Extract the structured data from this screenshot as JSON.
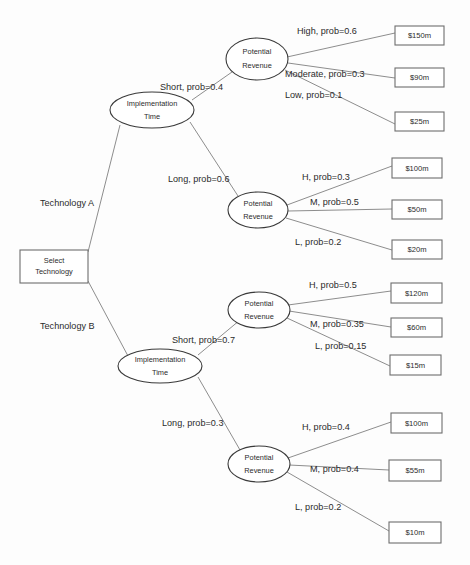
{
  "diagram": {
    "type": "decision-tree",
    "background_color": "#fdfdfd",
    "line_color": "#808080",
    "box_stroke_color": "#6e6e6e",
    "ellipse_stroke_color": "#3a3a3a",
    "text_color": "#2b2b2b"
  },
  "root": {
    "label_line1": "Select",
    "label_line2": "Technology",
    "shape": "rectangle",
    "x": 20,
    "y": 250,
    "w": 68,
    "h": 33
  },
  "decision_branches": [
    {
      "id": "tech-a",
      "label": "Technology A",
      "x": 40,
      "y": 204
    },
    {
      "id": "tech-b",
      "label": "Technology B",
      "x": 40,
      "y": 327
    }
  ],
  "chance_nodes": [
    {
      "id": "impl-time-a",
      "label_line1": "Implementation",
      "label_line2": "Time",
      "shape": "ellipse",
      "cx": 152,
      "cy": 110,
      "rx": 42,
      "ry": 18
    },
    {
      "id": "impl-time-b",
      "label_line1": "Implementation",
      "label_line2": "Time",
      "shape": "ellipse",
      "cx": 160,
      "cy": 366,
      "rx": 42,
      "ry": 17
    },
    {
      "id": "potential-revenue-1",
      "label_line1": "Potential",
      "label_line2": "Revenue",
      "shape": "ellipse",
      "cx": 257,
      "cy": 59,
      "rx": 31,
      "ry": 21
    },
    {
      "id": "potential-revenue-2",
      "label_line1": "Potential",
      "label_line2": "Revenue",
      "shape": "ellipse",
      "cx": 258,
      "cy": 210,
      "rx": 30,
      "ry": 18
    },
    {
      "id": "potential-revenue-3",
      "label_line1": "Potential",
      "label_line2": "Revenue",
      "shape": "ellipse",
      "cx": 259,
      "cy": 310,
      "rx": 31,
      "ry": 18
    },
    {
      "id": "potential-revenue-4",
      "label_line1": "Potential",
      "label_line2": "Revenue",
      "shape": "ellipse",
      "cx": 259,
      "cy": 464,
      "rx": 31,
      "ry": 18
    }
  ],
  "time_branches": [
    {
      "id": "a-short",
      "label": "Short, prob=0.4",
      "x": 160,
      "y": 88
    },
    {
      "id": "a-long",
      "label": "Long, prob=0.6",
      "x": 168,
      "y": 180
    },
    {
      "id": "b-short",
      "label": "Short, prob=0.7",
      "x": 172,
      "y": 341
    },
    {
      "id": "b-long",
      "label": "Long, prob=0.3",
      "x": 162,
      "y": 424
    }
  ],
  "revenue_branches": [
    {
      "id": "r1-high",
      "label": "High, prob=0.6",
      "x": 297,
      "y": 32
    },
    {
      "id": "r1-moderate",
      "label": "Moderate, prob=0.3",
      "x": 285,
      "y": 75
    },
    {
      "id": "r1-low",
      "label": "Low, prob=0.1",
      "x": 285,
      "y": 96
    },
    {
      "id": "r2-h",
      "label": "H, prob=0.3",
      "x": 302,
      "y": 178
    },
    {
      "id": "r2-m",
      "label": "M, prob=0.5",
      "x": 310,
      "y": 203
    },
    {
      "id": "r2-l",
      "label": "L, prob=0.2",
      "x": 295,
      "y": 243
    },
    {
      "id": "r3-h",
      "label": "H, prob=0.5",
      "x": 309,
      "y": 286
    },
    {
      "id": "r3-m",
      "label": "M, prob=0.35",
      "x": 310,
      "y": 325
    },
    {
      "id": "r3-l",
      "label": "L, prob=0.15",
      "x": 315,
      "y": 347
    },
    {
      "id": "r4-h",
      "label": "H, prob=0.4",
      "x": 302,
      "y": 428
    },
    {
      "id": "r4-m",
      "label": "M, prob=0.4",
      "x": 310,
      "y": 470
    },
    {
      "id": "r4-l",
      "label": "L, prob=0.2",
      "x": 295,
      "y": 508
    }
  ],
  "outcomes": [
    {
      "id": "outcome-150m",
      "label": "$150m",
      "x": 395,
      "y": 26,
      "w": 49,
      "h": 19
    },
    {
      "id": "outcome-90m",
      "label": "$90m",
      "x": 395,
      "y": 68,
      "w": 49,
      "h": 19
    },
    {
      "id": "outcome-25m",
      "label": "$25m",
      "x": 395,
      "y": 112,
      "w": 49,
      "h": 19
    },
    {
      "id": "outcome-100m-a",
      "label": "$100m",
      "x": 392,
      "y": 158,
      "w": 50,
      "h": 20
    },
    {
      "id": "outcome-50m",
      "label": "$50m",
      "x": 392,
      "y": 200,
      "w": 50,
      "h": 19
    },
    {
      "id": "outcome-20m",
      "label": "$20m",
      "x": 392,
      "y": 240,
      "w": 50,
      "h": 19
    },
    {
      "id": "outcome-120m",
      "label": "$120m",
      "x": 391,
      "y": 283,
      "w": 51,
      "h": 20
    },
    {
      "id": "outcome-60m",
      "label": "$60m",
      "x": 391,
      "y": 318,
      "w": 51,
      "h": 19
    },
    {
      "id": "outcome-15m",
      "label": "$15m",
      "x": 390,
      "y": 355,
      "w": 51,
      "h": 20
    },
    {
      "id": "outcome-100m-b",
      "label": "$100m",
      "x": 391,
      "y": 413,
      "w": 51,
      "h": 20
    },
    {
      "id": "outcome-55m",
      "label": "$55m",
      "x": 389,
      "y": 460,
      "w": 52,
      "h": 21
    },
    {
      "id": "outcome-10m",
      "label": "$10m",
      "x": 389,
      "y": 522,
      "w": 52,
      "h": 21
    }
  ]
}
